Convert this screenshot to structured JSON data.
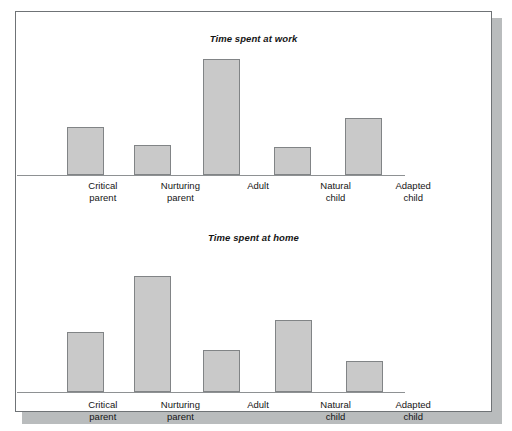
{
  "figure": {
    "background_color": "#ffffff",
    "border_color": "#6f7376",
    "shadow_color": "#b9bcbd"
  },
  "style": {
    "bar_fill": "#c9c9c9",
    "bar_stroke": "#818486",
    "axis_color": "#8e9193",
    "text_color": "#151515"
  },
  "charts": [
    {
      "id": "work",
      "title": "Time spent at work",
      "labels": [
        "Critical\nparent",
        "Nurturing\nparent",
        "Adult",
        "Natural\nchild",
        "Adapted\nchild"
      ]
    },
    {
      "id": "home",
      "title": "Time spent at home",
      "labels": [
        "Critical\nparent",
        "Nurturing\nparent",
        "Adult",
        "Natural\nchild",
        "Adapted\nchild"
      ]
    }
  ],
  "chart_data": [
    {
      "type": "bar",
      "title": "Time spent at work",
      "xlabel": "",
      "ylabel": "",
      "ylim": [
        0,
        130
      ],
      "grid": false,
      "legend": "none",
      "axis_ticks": [],
      "categories": [
        "Critical parent",
        "Nurturing parent",
        "Adult",
        "Natural child",
        "Adapted child"
      ],
      "values": [
        48,
        30,
        116,
        28,
        57
      ]
    },
    {
      "type": "bar",
      "title": "Time spent at home",
      "xlabel": "",
      "ylabel": "",
      "ylim": [
        0,
        130
      ],
      "grid": false,
      "legend": "none",
      "axis_ticks": [],
      "categories": [
        "Critical parent",
        "Nurturing parent",
        "Adult",
        "Natural child",
        "Adapted child"
      ],
      "values": [
        54,
        104,
        38,
        65,
        28
      ]
    }
  ]
}
